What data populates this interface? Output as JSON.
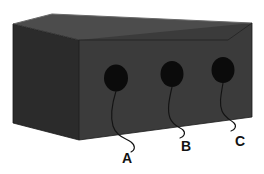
{
  "figure": {
    "background_color": "#ffffff",
    "width": 264,
    "height": 174
  },
  "box": {
    "name": "rectangular-block",
    "top_face": {
      "label": "top-face",
      "color": "#4c4c4c",
      "points": "13,24 52,14 252,23 228,40 79,40"
    },
    "left_face": {
      "label": "left-face",
      "color": "#2b2b2b",
      "points": "13,24 79,40 79,140 13,123"
    },
    "front_face": {
      "label": "front-face",
      "color": "#3b3b3b",
      "points": "79,40 252,23 252,117 79,140"
    },
    "edge_color": "#1f1f1f"
  },
  "holes": [
    {
      "id": "A",
      "cx": 116,
      "cy": 78,
      "rx": 12,
      "ry": 13.5,
      "color": "#0b0b0b"
    },
    {
      "id": "B",
      "cx": 172,
      "cy": 74,
      "rx": 11.5,
      "ry": 13,
      "color": "#0b0b0b"
    },
    {
      "id": "C",
      "cx": 223,
      "cy": 70,
      "rx": 11.5,
      "ry": 13,
      "color": "#0b0b0b"
    }
  ],
  "callouts": [
    {
      "id": "callout-a",
      "label": "A",
      "label_x": 127,
      "label_y": 159,
      "path": "M116,91 C112,104 110,116 113,126 C116,136 125,138 131,142 C136,146 135,150 131,152"
    },
    {
      "id": "callout-b",
      "label": "B",
      "label_x": 186,
      "label_y": 147,
      "path": "M172,87 C169,100 167,110 170,118 C173,126 180,127 183,130 C186,133 184,137 180,138"
    },
    {
      "id": "callout-c",
      "label": "C",
      "label_x": 240,
      "label_y": 142,
      "path": "M223,83 C221,95 219,104 222,111 C225,118 231,120 234,123 C237,126 235,130 231,131"
    }
  ]
}
